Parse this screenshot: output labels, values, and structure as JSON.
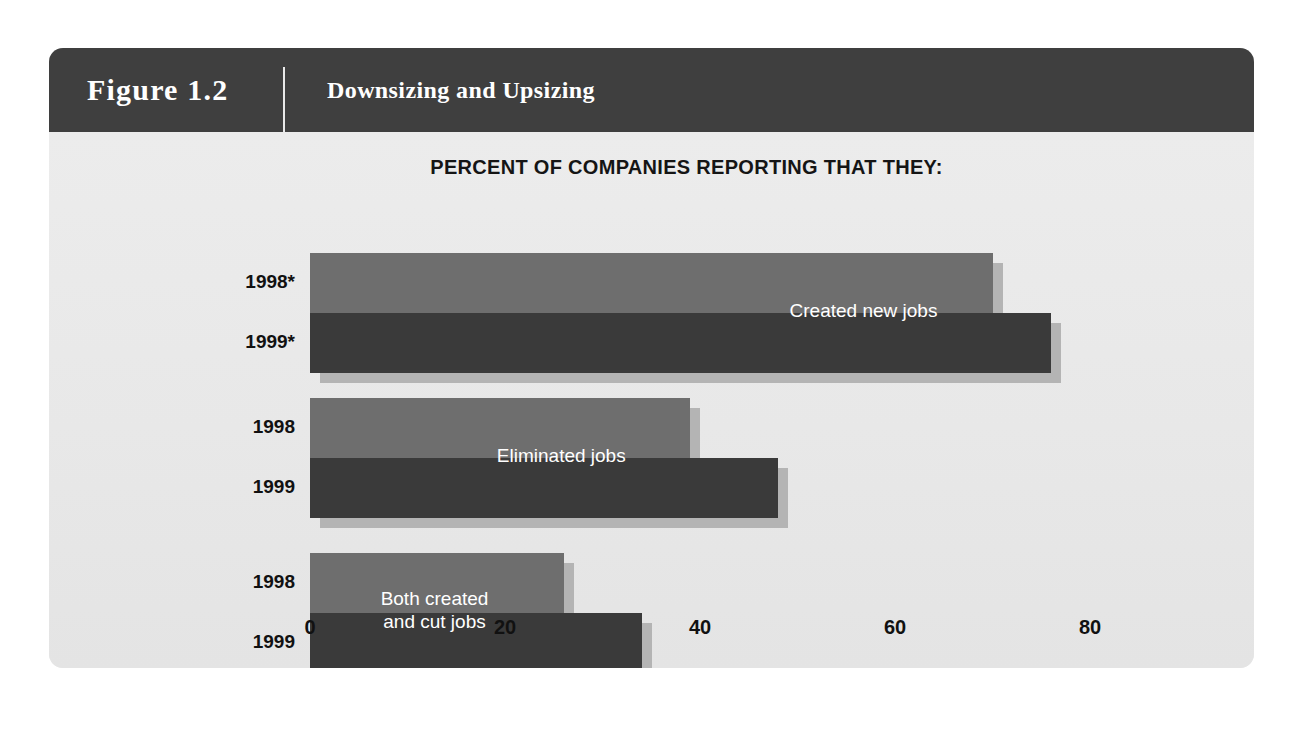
{
  "figure": {
    "number": "Figure 1.2",
    "title": "Downsizing and Upsizing"
  },
  "colors": {
    "header_bg": "#3f3f3f",
    "panel_bg": "#ebebeb",
    "series_1998": "#6e6e6e",
    "series_1999": "#3a3a3a",
    "shadow": "#b4b4b4",
    "label_text": "#111111",
    "bar_label_text": "#ffffff"
  },
  "chart_data": {
    "type": "bar",
    "orientation": "horizontal",
    "title": "PERCENT OF COMPANIES REPORTING THAT THEY:",
    "xlabel": "",
    "ylabel": "",
    "xlim": [
      0,
      84
    ],
    "xticks": [
      0,
      20,
      40,
      60,
      80
    ],
    "xtick_labels": [
      "0",
      "20",
      "40",
      "60",
      "80"
    ],
    "grid": false,
    "legend": "none",
    "categories": [
      "Created new jobs",
      "Eliminated jobs",
      "Both created\nand cut jobs"
    ],
    "series": [
      {
        "name": "1998",
        "values": [
          70,
          39,
          26
        ]
      },
      {
        "name": "1999",
        "values": [
          76,
          48,
          34
        ]
      }
    ],
    "groups": [
      {
        "label": "Created new jobs",
        "bars": [
          {
            "year_label": "1998*",
            "series": "1998",
            "value": 70
          },
          {
            "year_label": "1999*",
            "series": "1999",
            "value": 76
          }
        ]
      },
      {
        "label": "Eliminated jobs",
        "bars": [
          {
            "year_label": "1998",
            "series": "1998",
            "value": 39
          },
          {
            "year_label": "1999",
            "series": "1999",
            "value": 48
          }
        ]
      },
      {
        "label": "Both created\nand cut jobs",
        "bars": [
          {
            "year_label": "1998",
            "series": "1998",
            "value": 26
          },
          {
            "year_label": "1999",
            "series": "1999",
            "value": 34
          }
        ]
      }
    ]
  }
}
